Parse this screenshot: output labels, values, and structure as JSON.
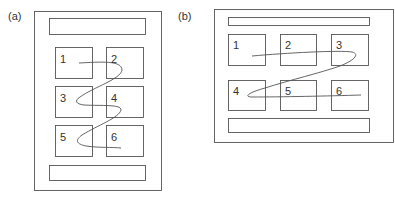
{
  "panels": [
    {
      "id": "a",
      "label": "(a)",
      "layout": "portrait, 2 columns x 3 rows",
      "boxes": [
        "1",
        "2",
        "3",
        "4",
        "5",
        "6"
      ],
      "reading_path": "zigzag left-to-right, row by row (1→2→3→4→5→6)"
    },
    {
      "id": "b",
      "label": "(b)",
      "layout": "landscape, 3 columns x 2 rows",
      "boxes": [
        "1",
        "2",
        "3",
        "4",
        "5",
        "6"
      ],
      "reading_path": "zigzag left-to-right, row by row (1→2→3→4→5→6)"
    }
  ],
  "colors": {
    "stroke": "#555555",
    "text": "#333333",
    "background": "#ffffff"
  }
}
